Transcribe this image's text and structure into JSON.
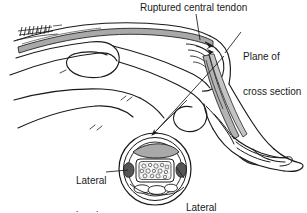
{
  "figure": {
    "kind": "medical-line-illustration",
    "background_color": "#ffffff",
    "ink_color": "#1a1a1a",
    "tendon_gray": "#a9a9a9",
    "tendon_gray_light": "#c4c4c4",
    "stipple_gray": "#8c8c8c"
  },
  "labels": {
    "ruptured_tendon": "Ruptured central tendon",
    "plane_line1": "Plane of",
    "plane_line2": "cross section",
    "lateral_band_left_line1": "Lateral",
    "lateral_band_left_line2": "band",
    "lateral_band_right_line1": "Lateral",
    "lateral_band_right_line2": "band"
  },
  "annotations": {
    "leader_ruptured": "vertical leader from title down to rupture site",
    "leader_plane": "diagonal leader from plane-of-cross-section text",
    "arrow_to_inset": "arrow pointing down-left to cross section circle",
    "leader_lateral_left": "horizontal leader to left lateral band",
    "leader_lateral_right": "diagonal leader up-left to right lateral band"
  },
  "cross_section": {
    "center_x": 155,
    "center_y": 169,
    "outer_radius": 36,
    "parts": [
      "skin-outer-ring",
      "subcutaneous-ring",
      "extensor-hood-gray-crescent",
      "phalanx-bone-stippled-core",
      "lateral-band-left-dark",
      "lateral-band-right-dark",
      "flexor-tendon-ovals"
    ]
  }
}
